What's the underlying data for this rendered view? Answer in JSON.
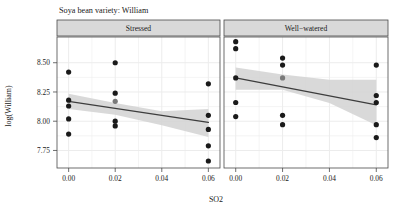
{
  "chart_data": {
    "type": "scatter",
    "title": "Soya bean variety: William",
    "xlabel": "SO2",
    "ylabel": "log(William)",
    "xlim": [
      -0.005,
      0.065
    ],
    "ylim": [
      7.6,
      8.72
    ],
    "xticks": [
      0.0,
      0.02,
      0.04,
      0.06
    ],
    "xtick_labels": [
      "0.00",
      "0.02",
      "0.04",
      "0.06"
    ],
    "yticks": [
      7.75,
      8.0,
      8.25,
      8.5
    ],
    "ytick_labels": [
      "7.75",
      "8.00",
      "8.25",
      "8.50"
    ],
    "grid": true,
    "minor_grid": true,
    "legend": "none",
    "facet_variable": "water treatment",
    "panels": [
      {
        "label": "Stressed",
        "points": [
          {
            "x": 0.0,
            "y": 8.42,
            "color": "#1a1a1a"
          },
          {
            "x": 0.0,
            "y": 8.18,
            "color": "#1a1a1a"
          },
          {
            "x": 0.0,
            "y": 8.13,
            "color": "#1a1a1a"
          },
          {
            "x": 0.0,
            "y": 8.02,
            "color": "#1a1a1a"
          },
          {
            "x": 0.0,
            "y": 7.89,
            "color": "#1a1a1a"
          },
          {
            "x": 0.02,
            "y": 8.5,
            "color": "#1a1a1a"
          },
          {
            "x": 0.02,
            "y": 8.24,
            "color": "#1a1a1a"
          },
          {
            "x": 0.02,
            "y": 8.17,
            "color": "#7a7a7a"
          },
          {
            "x": 0.02,
            "y": 8.0,
            "color": "#1a1a1a"
          },
          {
            "x": 0.02,
            "y": 7.96,
            "color": "#1a1a1a"
          },
          {
            "x": 0.06,
            "y": 8.32,
            "color": "#1a1a1a"
          },
          {
            "x": 0.06,
            "y": 8.05,
            "color": "#1a1a1a"
          },
          {
            "x": 0.06,
            "y": 7.93,
            "color": "#1a1a1a"
          },
          {
            "x": 0.06,
            "y": 7.79,
            "color": "#1a1a1a"
          },
          {
            "x": 0.06,
            "y": 7.66,
            "color": "#1a1a1a"
          }
        ],
        "fit_line": {
          "x0": 0.0,
          "y0": 8.17,
          "x1": 0.06,
          "y1": 7.99
        },
        "confidence_band": {
          "upper": [
            {
              "x": 0.0,
              "y": 8.235
            },
            {
              "x": 0.02,
              "y": 8.155
            },
            {
              "x": 0.04,
              "y": 8.085
            },
            {
              "x": 0.06,
              "y": 8.105
            }
          ],
          "lower": [
            {
              "x": 0.0,
              "y": 8.105
            },
            {
              "x": 0.02,
              "y": 8.055
            },
            {
              "x": 0.04,
              "y": 7.965
            },
            {
              "x": 0.06,
              "y": 7.865
            }
          ]
        }
      },
      {
        "label": "Well−watered",
        "points": [
          {
            "x": 0.0,
            "y": 8.68,
            "color": "#1a1a1a"
          },
          {
            "x": 0.0,
            "y": 8.62,
            "color": "#1a1a1a"
          },
          {
            "x": 0.0,
            "y": 8.37,
            "color": "#1a1a1a"
          },
          {
            "x": 0.0,
            "y": 8.16,
            "color": "#1a1a1a"
          },
          {
            "x": 0.0,
            "y": 8.04,
            "color": "#1a1a1a"
          },
          {
            "x": 0.02,
            "y": 8.54,
            "color": "#1a1a1a"
          },
          {
            "x": 0.02,
            "y": 8.48,
            "color": "#1a1a1a"
          },
          {
            "x": 0.02,
            "y": 8.37,
            "color": "#7a7a7a"
          },
          {
            "x": 0.02,
            "y": 8.05,
            "color": "#1a1a1a"
          },
          {
            "x": 0.02,
            "y": 7.97,
            "color": "#1a1a1a"
          },
          {
            "x": 0.06,
            "y": 8.48,
            "color": "#1a1a1a"
          },
          {
            "x": 0.06,
            "y": 8.22,
            "color": "#1a1a1a"
          },
          {
            "x": 0.06,
            "y": 8.16,
            "color": "#1a1a1a"
          },
          {
            "x": 0.06,
            "y": 7.97,
            "color": "#1a1a1a"
          },
          {
            "x": 0.06,
            "y": 7.86,
            "color": "#1a1a1a"
          }
        ],
        "fit_line": {
          "x0": 0.0,
          "y0": 8.37,
          "x1": 0.06,
          "y1": 8.14
        },
        "confidence_band": {
          "upper": [
            {
              "x": 0.0,
              "y": 8.46
            },
            {
              "x": 0.02,
              "y": 8.4
            },
            {
              "x": 0.04,
              "y": 8.355
            },
            {
              "x": 0.06,
              "y": 8.355
            }
          ],
          "lower": [
            {
              "x": 0.0,
              "y": 8.27
            },
            {
              "x": 0.02,
              "y": 8.27
            },
            {
              "x": 0.04,
              "y": 8.155
            },
            {
              "x": 0.06,
              "y": 7.965
            }
          ]
        }
      }
    ],
    "style": {
      "point_color": "#1a1a1a",
      "highlight_point_color": "#7a7a7a",
      "line_color": "#3d3d3d",
      "band_color": "#d2d2d2",
      "panel_background": "#ffffff",
      "grid_color": "#ececec",
      "strip_background": "#d9d9d9",
      "border_color": "#4a4a4a"
    }
  }
}
